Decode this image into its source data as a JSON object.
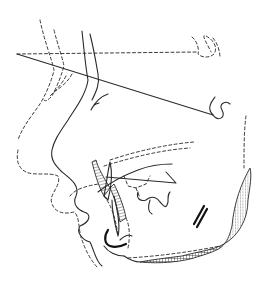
{
  "figure": {
    "type": "cephalometric-tracing",
    "description": "Lateral profile tracing: soft tissue outline (solid), superimposed dashed outline, reference line, dashed horizontal reference plane, incisors with hatched regions, mandibular symphysis cross-hatched",
    "colors": {
      "background": "#ffffff",
      "stroke": "#2a2a2a"
    }
  }
}
